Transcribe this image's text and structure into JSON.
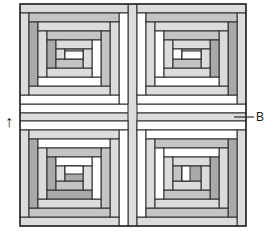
{
  "diagram": {
    "colors": {
      "outline": "#2b2b2b",
      "white": "#ffffff",
      "light": "#dcdcdc",
      "mid": "#c4c4c4",
      "dark": "#a9a9a9"
    },
    "ring_width": 9,
    "blocks": [
      {
        "name": "block-top-left",
        "x": 20,
        "y": 4,
        "w": 108,
        "h": 100,
        "rings": [
          {
            "top": "light",
            "right": "white",
            "bottom": "white",
            "left": "light"
          },
          {
            "top": "mid",
            "right": "light",
            "bottom": "light",
            "left": "dark"
          },
          {
            "top": "light",
            "right": "mid",
            "bottom": "white",
            "left": "light"
          },
          {
            "top": "mid",
            "right": "white",
            "bottom": "light",
            "left": "dark"
          },
          {
            "top": "light",
            "right": "light",
            "bottom": "mid",
            "left": "light"
          }
        ],
        "center": {
          "fill": "dark",
          "bottom": "white"
        }
      },
      {
        "name": "block-top-right",
        "x": 137,
        "y": 4,
        "w": 109,
        "h": 100,
        "rings": [
          {
            "top": "light",
            "right": "light",
            "bottom": "white",
            "left": "white"
          },
          {
            "top": "mid",
            "right": "dark",
            "bottom": "light",
            "left": "light"
          },
          {
            "top": "light",
            "right": "light",
            "bottom": "white",
            "left": "white"
          },
          {
            "top": "mid",
            "right": "dark",
            "bottom": "light",
            "left": "light"
          },
          {
            "top": "light",
            "right": "light",
            "bottom": "mid",
            "left": "white"
          }
        ],
        "center": {
          "fill": "dark",
          "bottom": "white"
        }
      },
      {
        "name": "block-bottom-left",
        "x": 20,
        "y": 121,
        "w": 108,
        "h": 105,
        "rings": [
          {
            "top": "white",
            "right": "white",
            "bottom": "light",
            "left": "light"
          },
          {
            "top": "light",
            "right": "light",
            "bottom": "mid",
            "left": "dark"
          },
          {
            "top": "white",
            "right": "mid",
            "bottom": "light",
            "left": "light"
          },
          {
            "top": "mid",
            "right": "white",
            "bottom": "dark",
            "left": "dark"
          },
          {
            "top": "white",
            "right": "light",
            "bottom": "mid",
            "left": "light"
          }
        ],
        "center": {
          "fill": "dark",
          "top": "white"
        }
      },
      {
        "name": "block-bottom-right",
        "x": 137,
        "y": 121,
        "w": 109,
        "h": 105,
        "rings": [
          {
            "top": "white",
            "right": "light",
            "bottom": "light",
            "left": "white"
          },
          {
            "top": "white",
            "right": "dark",
            "bottom": "mid",
            "left": "light"
          },
          {
            "top": "mid",
            "right": "light",
            "bottom": "light",
            "left": "white"
          },
          {
            "top": "white",
            "right": "dark",
            "bottom": "mid",
            "left": "light"
          },
          {
            "top": "light",
            "right": "light",
            "bottom": "light",
            "left": "mid"
          }
        ],
        "center": {
          "fill": "dark",
          "left": "white"
        }
      }
    ],
    "sashing": {
      "vertical": {
        "x": 128,
        "y": 4,
        "w": 9,
        "h": 222,
        "fill": "light"
      },
      "horizontal": {
        "x": 20,
        "y": 113,
        "w": 226,
        "h": 8,
        "fill": "light"
      },
      "top_white_strip": {
        "x": 20,
        "y": 104,
        "w": 226,
        "h": 9,
        "fill": "white"
      }
    },
    "annotations": {
      "label_b": "B",
      "arrow": "↑"
    }
  }
}
